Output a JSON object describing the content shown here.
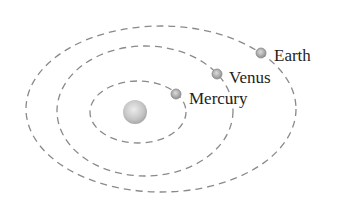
{
  "diagram": {
    "title": "",
    "sun": {
      "cx": 135,
      "cy": 112,
      "r": 12
    },
    "orbits": [
      {
        "name": "mercury-orbit",
        "cx": 138,
        "cy": 112,
        "rx": 48,
        "ry": 31
      },
      {
        "name": "venus-orbit",
        "cx": 145,
        "cy": 111,
        "rx": 88,
        "ry": 65
      },
      {
        "name": "earth-orbit",
        "cx": 161,
        "cy": 109,
        "rx": 135,
        "ry": 83
      }
    ],
    "planets": [
      {
        "name": "Mercury",
        "cx": 176,
        "cy": 94,
        "r": 5,
        "label_x": 189,
        "label_y": 104
      },
      {
        "name": "Venus",
        "cx": 217,
        "cy": 74,
        "r": 5,
        "label_x": 229,
        "label_y": 83
      },
      {
        "name": "Earth",
        "cx": 261,
        "cy": 53,
        "r": 5,
        "label_x": 274,
        "label_y": 61
      }
    ],
    "labels": {
      "mercury": "Mercury",
      "venus": "Venus",
      "earth": "Earth"
    },
    "colors": {
      "orbit": "#8a8a8a",
      "sun_light": "#e6e6e6",
      "sun_dark": "#a8a8a8",
      "planet_light": "#d8d8d8",
      "planet_dark": "#8c8c8c",
      "text": "#1e1e1e"
    }
  }
}
